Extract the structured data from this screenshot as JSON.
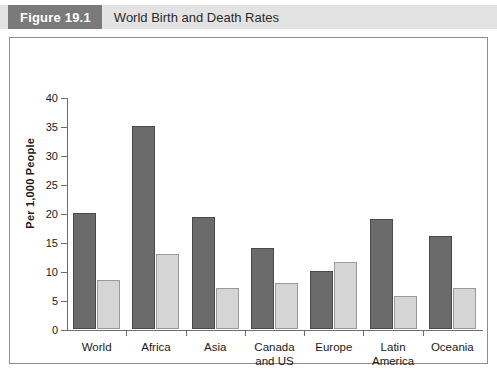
{
  "figure": {
    "number_label": "Figure 19.1",
    "title": "World Birth and Death Rates"
  },
  "chart_data": {
    "type": "bar",
    "title": "World Birth and Death Rates",
    "xlabel": "",
    "ylabel": "Per 1,000 People",
    "ylim": [
      0,
      40
    ],
    "yticks": [
      0,
      5,
      10,
      15,
      20,
      25,
      30,
      35,
      40
    ],
    "grid": false,
    "legend_position": "bottom-center",
    "categories": [
      "World",
      "Africa",
      "Asia",
      "Canada and US",
      "Europe",
      "Latin America",
      "Oceania"
    ],
    "category_lines": [
      [
        "World"
      ],
      [
        "Africa"
      ],
      [
        "Asia"
      ],
      [
        "Canada",
        "and US"
      ],
      [
        "Europe"
      ],
      [
        "Latin",
        "America"
      ],
      [
        "Oceania"
      ]
    ],
    "series": [
      {
        "name": "Births",
        "color": "#6b6b6b",
        "values": [
          20,
          35,
          19.3,
          14,
          10,
          19,
          16
        ]
      },
      {
        "name": "Deaths",
        "color": "#d5d5d5",
        "values": [
          8.5,
          13,
          7,
          8,
          11.5,
          5.7,
          7
        ]
      }
    ]
  },
  "legend": {
    "items": [
      {
        "label": "Births",
        "swatch": "births"
      },
      {
        "label": "Deaths",
        "swatch": "deaths"
      }
    ]
  },
  "colors": {
    "header_band": "#e3e3e3",
    "header_tag": "#7a7a7a",
    "births": "#6b6b6b",
    "deaths": "#d5d5d5",
    "frame": "#8d8d8d"
  }
}
